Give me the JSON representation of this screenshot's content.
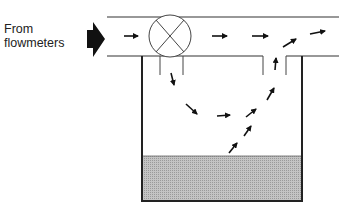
{
  "diagram": {
    "label_line1": "From",
    "label_line2": "flowmeters",
    "elements": {
      "inlet_arrow": "large-black-arrow",
      "valve": "circle-x-valve",
      "pipe": "horizontal-pipe",
      "tank": "open-tank-with-liquid",
      "flow_arrows": "small-flow-direction-arrows",
      "exhaust": "vertical-vent-chimney"
    },
    "colors": {
      "line": "#333333",
      "liquid": "#bdbdbd",
      "arrow": "#111111"
    }
  }
}
